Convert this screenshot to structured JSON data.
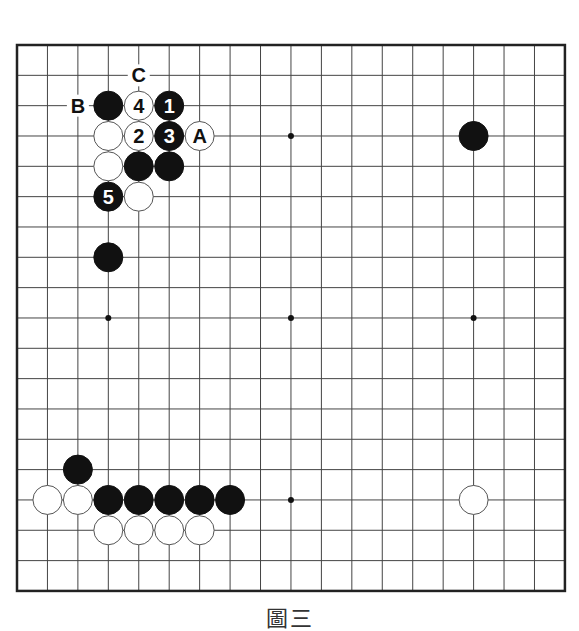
{
  "board": {
    "size": 19,
    "origin_x": 17,
    "origin_y": 45,
    "step_x": 30.44,
    "step_y": 30.33,
    "line_color": "#444444",
    "border_color": "#222222",
    "star_points": [
      [
        3,
        3
      ],
      [
        9,
        3
      ],
      [
        15,
        3
      ],
      [
        3,
        9
      ],
      [
        9,
        9
      ],
      [
        15,
        9
      ],
      [
        3,
        15
      ],
      [
        9,
        15
      ],
      [
        15,
        15
      ]
    ],
    "visible_star_points": [
      [
        9,
        3
      ],
      [
        3,
        9
      ],
      [
        9,
        9
      ],
      [
        15,
        9
      ],
      [
        9,
        15
      ]
    ]
  },
  "stones": [
    {
      "color": "black",
      "col": 3,
      "row": 2,
      "label": ""
    },
    {
      "color": "white",
      "col": 4,
      "row": 2,
      "label": "4"
    },
    {
      "color": "black",
      "col": 5,
      "row": 2,
      "label": "1"
    },
    {
      "color": "white",
      "col": 3,
      "row": 3,
      "label": ""
    },
    {
      "color": "white",
      "col": 4,
      "row": 3,
      "label": "2"
    },
    {
      "color": "black",
      "col": 5,
      "row": 3,
      "label": "3"
    },
    {
      "color": "white",
      "col": 6,
      "row": 3,
      "label": "A"
    },
    {
      "color": "white",
      "col": 3,
      "row": 4,
      "label": ""
    },
    {
      "color": "black",
      "col": 4,
      "row": 4,
      "label": ""
    },
    {
      "color": "black",
      "col": 5,
      "row": 4,
      "label": ""
    },
    {
      "color": "black",
      "col": 3,
      "row": 5,
      "label": "5"
    },
    {
      "color": "white",
      "col": 4,
      "row": 5,
      "label": ""
    },
    {
      "color": "black",
      "col": 3,
      "row": 7,
      "label": ""
    },
    {
      "color": "black",
      "col": 15,
      "row": 3,
      "label": ""
    },
    {
      "color": "black",
      "col": 2,
      "row": 14,
      "label": ""
    },
    {
      "color": "white",
      "col": 1,
      "row": 15,
      "label": ""
    },
    {
      "color": "white",
      "col": 2,
      "row": 15,
      "label": ""
    },
    {
      "color": "black",
      "col": 3,
      "row": 15,
      "label": ""
    },
    {
      "color": "black",
      "col": 4,
      "row": 15,
      "label": ""
    },
    {
      "color": "black",
      "col": 5,
      "row": 15,
      "label": ""
    },
    {
      "color": "black",
      "col": 6,
      "row": 15,
      "label": ""
    },
    {
      "color": "black",
      "col": 7,
      "row": 15,
      "label": ""
    },
    {
      "color": "white",
      "col": 3,
      "row": 16,
      "label": ""
    },
    {
      "color": "white",
      "col": 4,
      "row": 16,
      "label": ""
    },
    {
      "color": "white",
      "col": 5,
      "row": 16,
      "label": ""
    },
    {
      "color": "white",
      "col": 6,
      "row": 16,
      "label": ""
    },
    {
      "color": "white",
      "col": 15,
      "row": 15,
      "label": ""
    }
  ],
  "point_labels": [
    {
      "col": 2,
      "row": 2,
      "label": "B"
    },
    {
      "col": 4,
      "row": 1,
      "label": "C"
    }
  ],
  "caption": "圖三"
}
